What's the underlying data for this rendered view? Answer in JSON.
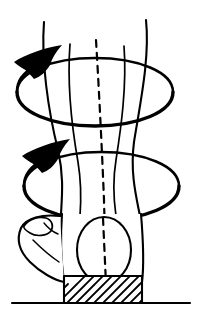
{
  "figure": {
    "title": "Tibial rotation over fixed foot",
    "domain": "anatomical-line-diagram",
    "background_color": "#ffffff",
    "ink_color": "#000000",
    "canvas": {
      "width": 198,
      "height": 318
    },
    "style": "black ink line drawing, no text labels, no shading except hatching"
  },
  "elements": {
    "leg": {
      "name": "lower-leg-shaft",
      "description": "Frontal view of lower leg (tibia/fibula shaft) narrowing toward the ankle then flaring at the malleoli",
      "outer_left_contour": "M 44,22 C 41,60 48,110 58,150 C 64,176 62,196 61,214",
      "outer_right_contour": "M 146,20 C 150,58 140,104 134,142 C 130,172 136,196 140,216",
      "inner_left_line": "M 70,44 C 67,84 72,128 78,162 C 82,186 81,202 80,216",
      "inner_right_line": "M 124,46 C 127,86 121,128 116,160 C 112,184 114,202 116,216",
      "inner_line_count": 2,
      "outer_line_count": 2
    },
    "axis": {
      "name": "mechanical-axis",
      "style": "dashed",
      "dash_pattern": "7 6",
      "path": "M 96,40 C 99,90 102,150 104,200 C 105,240 106,268 106,286",
      "description": "Vertical dashed long axis of the tibia passing through the center of the talus"
    },
    "rotation_arrows": [
      {
        "name": "upper-rotation-ellipse",
        "center": {
          "cx": 95,
          "cy": 92
        },
        "radius": {
          "rx": 78,
          "ry": 30
        },
        "direction": "counter-clockwise-viewed-from-above",
        "arrowhead_at": {
          "x": 46,
          "y": 64
        },
        "stroke_width_max": 3.4,
        "description": "Upper circular arrow indicating axial rotation of the proximal leg segment"
      },
      {
        "name": "lower-rotation-ellipse",
        "center": {
          "cx": 100,
          "cy": 186
        },
        "radius": {
          "rx": 78,
          "ry": 30
        },
        "direction": "counter-clockwise-viewed-from-above",
        "arrowhead_at": {
          "x": 56,
          "y": 156
        },
        "stroke_width_max": 3.4,
        "description": "Lower circular arrow indicating axial rotation at the ankle/distal segment"
      }
    ],
    "arrowheads": {
      "name": "rotation-arrowhead",
      "shape": "swept-back dart",
      "count": 2,
      "fill": "#000000"
    },
    "talus_oval": {
      "name": "talus-oval",
      "description": "Egg shaped outline of the talus / distal tibia seen end-on",
      "cx": 104,
      "cy": 250,
      "rx": 27,
      "ry": 33
    },
    "foot_block": {
      "name": "foot-body",
      "description": "Bulk of the hindfoot seen from the front, enclosing the talus oval",
      "path": "M 62,214 C 60,240 62,268 64,282 L 142,282 C 144,266 143,238 141,214 Z"
    },
    "heel": {
      "name": "heel-calcaneus",
      "description": "Calcaneus projecting to the left with small tubercle detail at its top",
      "outline": "M 60,216 C 42,214 26,218 21,228 C 16,240 20,252 30,262 C 40,272 54,280 64,282"
    },
    "heel_detail": {
      "name": "heel-tubercle-detail",
      "description": "Small hook/knob contour at the superior heel, crossed by the lower rotation ellipse"
    },
    "ground_block": {
      "name": "ground-support-block",
      "description": "Hatched rectangular block representing the fixed supporting surface under the foot",
      "x": 64,
      "y": 276,
      "width": 78,
      "height": 27,
      "hatch_angle_degrees": 45,
      "hatch_spacing": 9,
      "fill": "#ffffff"
    },
    "ground_line": {
      "name": "ground-line",
      "description": "Horizontal floor line",
      "x1": 12,
      "y1": 303,
      "x2": 190,
      "y2": 303,
      "stroke_width": 2.2
    }
  },
  "legend": {
    "has_text_labels": false,
    "label_count": 0
  }
}
